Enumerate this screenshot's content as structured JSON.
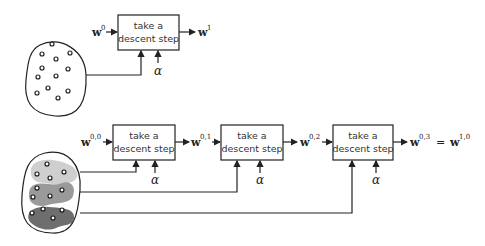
{
  "top_diagram": {
    "box_label_line1": "take a",
    "box_label_line2": "descent step",
    "input_var": "w",
    "input_sup": "0",
    "output_var": "w",
    "output_sup": "1",
    "step_param": "α",
    "dataset_points": 13
  },
  "bottom_diagram": {
    "boxes": [
      {
        "line1": "take a",
        "line2": "descent step",
        "in_var": "w",
        "in_sup": "0,0",
        "param": "α"
      },
      {
        "line1": "take a",
        "line2": "descent step",
        "in_var": "w",
        "in_sup": "0,1",
        "param": "α"
      },
      {
        "line1": "take a",
        "line2": "descent step",
        "in_var": "w",
        "in_sup": "0,2",
        "param": "α"
      }
    ],
    "final_output": {
      "lhs_var": "w",
      "lhs_sup": "0,3",
      "eq": "=",
      "rhs_var": "w",
      "rhs_sup": "1,0"
    },
    "minibatches": [
      {
        "shade": "#cfcfcf",
        "points": 4
      },
      {
        "shade": "#9a9a9a",
        "points": 4
      },
      {
        "shade": "#6e6e6e",
        "points": 4
      }
    ]
  }
}
